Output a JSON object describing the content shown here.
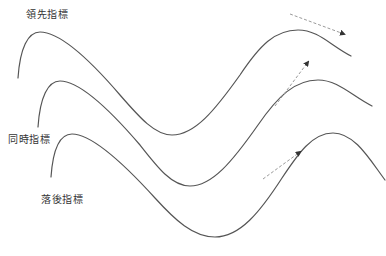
{
  "diagram": {
    "title": "",
    "colors": {
      "curve": "#555555",
      "arrow": "#9a9a9a",
      "arrowhead": "#333333",
      "text": "#333333",
      "background": "#ffffff"
    },
    "indicators": [
      {
        "id": "leading",
        "label": "領先指標",
        "label_pos": {
          "x": 26,
          "y": 9
        },
        "curve_path": "M 18 78 C 20 48, 28 32, 40 32 C 60 32, 90 60, 120 95 C 140 118, 155 135, 172 135 C 195 135, 215 110, 240 75 C 260 45, 275 30, 298 30 C 318 30, 330 45, 351 56",
        "trend_arrow": {
          "x1": 290,
          "y1": 14,
          "x2": 344,
          "y2": 34,
          "direction": "down-right"
        }
      },
      {
        "id": "coincident",
        "label": "同時指標",
        "label_pos": {
          "x": 8,
          "y": 134
        },
        "curve_path": "M 38 127 C 40 97, 48 81, 60 81 C 80 81, 110 110, 140 145 C 158 168, 172 186, 190 186 C 212 186, 232 162, 258 125 C 278 96, 295 80, 318 80 C 338 80, 352 96, 372 106",
        "trend_arrow": {
          "x1": 275,
          "y1": 106,
          "x2": 308,
          "y2": 62,
          "direction": "up-right"
        }
      },
      {
        "id": "lagging",
        "label": "落後指標",
        "label_pos": {
          "x": 41,
          "y": 194
        },
        "curve_path": "M 51 177 C 53 148, 60 134, 72 134 C 92 134, 125 165, 155 198 C 175 220, 193 237, 215 237 C 240 237, 260 212, 282 178 C 298 154, 312 133, 333 133 C 355 133, 370 160, 385 180",
        "trend_arrow": {
          "x1": 263,
          "y1": 179,
          "x2": 300,
          "y2": 152,
          "direction": "up-right"
        }
      }
    ]
  }
}
